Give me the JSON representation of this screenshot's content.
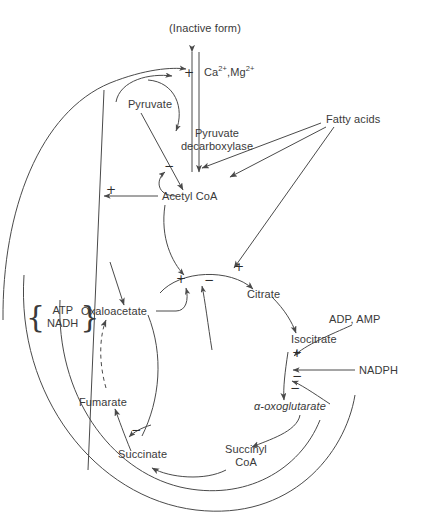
{
  "diagram": {
    "stroke_color": "#4a4a4a",
    "text_color": "#3a3a3a",
    "nodes": {
      "inactive_form": "(Inactive form)",
      "ions": {
        "ca": "Ca",
        "ca_charge": "2+",
        "sep": ",",
        "mg": "Mg",
        "mg_charge": "2+"
      },
      "pyruvate": "Pyruvate",
      "pyruvate_decarboxylase_l1": "Pyruvate",
      "pyruvate_decarboxylase_l2": "decarboxylase",
      "acetyl_coa": "Acetyl  CoA",
      "fatty_acids": "Fatty acids",
      "oxaloacetate": "Oxaloacetate",
      "citrate": "Citrate",
      "isocitrate": "Isocitrate",
      "adp_amp": "ADP, AMP",
      "nadph": "NADPH",
      "oxoglutarate": "α-oxoglutarate",
      "succinyl_coa_l1": "Succinyl",
      "succinyl_coa_l2": "CoA",
      "succinate": "Succinate",
      "fumarate": "Fumarate",
      "energy_brace": {
        "open": "{",
        "line1": "ATP",
        "line2": "NADH",
        "close": "}"
      }
    },
    "signs": {
      "pdh_activation": "+",
      "pdh_inhibition": "−",
      "acetyl_coa_plus": "+",
      "cs_plus_left": "+",
      "cs_minus_right": "−",
      "cs_plus_top": "+",
      "isocitrate_plus": "+",
      "isocitrate_minus_1": "−",
      "isocitrate_minus_2": "−",
      "succinate_minus": "−"
    }
  }
}
